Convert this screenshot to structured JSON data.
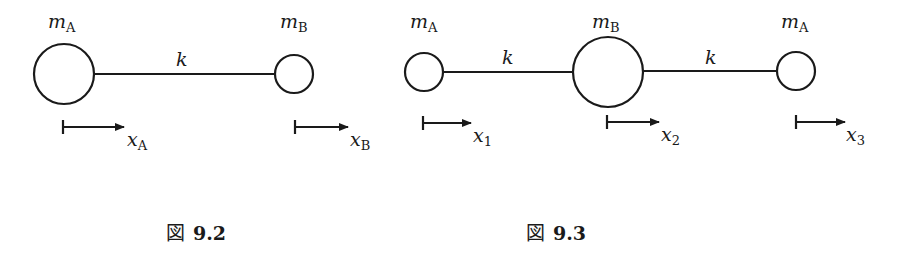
{
  "figures": [
    {
      "caption_prefix": "図",
      "caption_number": "9.2",
      "masses": [
        {
          "symbol": "m",
          "subscript": "A",
          "cx": 64,
          "cy": 74,
          "r": 30
        },
        {
          "symbol": "m",
          "subscript": "B",
          "cx": 294,
          "cy": 74,
          "r": 19
        }
      ],
      "springs": [
        {
          "label": "k",
          "x1": 94,
          "x2": 275,
          "y": 74
        }
      ],
      "displacements": [
        {
          "symbol": "x",
          "subscript": "A",
          "x1": 63,
          "x2": 125,
          "y": 127
        },
        {
          "symbol": "x",
          "subscript": "B",
          "x1": 295,
          "x2": 349,
          "y": 127
        }
      ]
    },
    {
      "caption_prefix": "図",
      "caption_number": "9.3",
      "masses": [
        {
          "symbol": "m",
          "subscript": "A",
          "cx": 424,
          "cy": 72,
          "r": 19
        },
        {
          "symbol": "m",
          "subscript": "B",
          "cx": 608,
          "cy": 72,
          "r": 35
        },
        {
          "symbol": "m",
          "subscript": "A",
          "cx": 796,
          "cy": 71,
          "r": 19
        }
      ],
      "springs": [
        {
          "label": "k",
          "x1": 443,
          "x2": 573,
          "y": 72
        },
        {
          "label": "k",
          "x1": 643,
          "x2": 777,
          "y": 71
        }
      ],
      "displacements": [
        {
          "symbol": "x",
          "subscript": "1",
          "x1": 423,
          "x2": 472,
          "y": 123
        },
        {
          "symbol": "x",
          "subscript": "2",
          "x1": 607,
          "x2": 660,
          "y": 122
        },
        {
          "symbol": "x",
          "subscript": "3",
          "x1": 796,
          "x2": 846,
          "y": 122
        }
      ]
    }
  ],
  "colors": {
    "stroke": "#1a1a1a",
    "background": "#ffffff"
  }
}
